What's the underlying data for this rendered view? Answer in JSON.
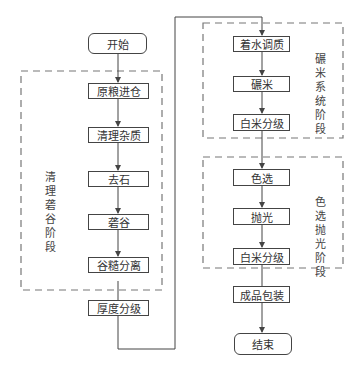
{
  "diagram": {
    "type": "flowchart",
    "start": "开始",
    "end": "结束",
    "groups": [
      {
        "label": "清理砻谷阶段",
        "steps": [
          "原粮进仓",
          "清理杂质",
          "去石",
          "砻谷",
          "谷糙分离",
          "厚度分级"
        ]
      },
      {
        "label": "碾米系统阶段",
        "steps": [
          "着水调质",
          "碾米",
          "白米分级"
        ]
      },
      {
        "label": "色选抛光阶段",
        "steps": [
          "色选",
          "抛光",
          "白米分级",
          "成品包装"
        ]
      }
    ],
    "colors": {
      "line": "#444444",
      "dashed_border": "#777777",
      "text": "#333333"
    }
  }
}
